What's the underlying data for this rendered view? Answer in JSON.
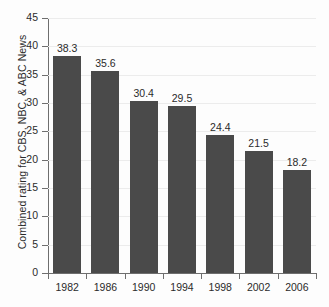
{
  "chart_data": {
    "type": "bar",
    "title": "",
    "xlabel": "",
    "ylabel": "Combined rating for CBS, NBC, & ABC News",
    "categories": [
      "1982",
      "1986",
      "1990",
      "1994",
      "1998",
      "2002",
      "2006"
    ],
    "values": [
      38.3,
      35.6,
      30.4,
      29.5,
      24.4,
      21.5,
      18.2
    ],
    "value_labels": [
      "38.3",
      "35.6",
      "30.4",
      "29.5",
      "24.4",
      "21.5",
      "18.2"
    ],
    "ylim": [
      0,
      45
    ],
    "ytick_labels": [
      "0",
      "5",
      "10",
      "15",
      "20",
      "25",
      "30",
      "35",
      "40",
      "45"
    ],
    "ytick_values": [
      0,
      5,
      10,
      15,
      20,
      25,
      30,
      35,
      40,
      45
    ],
    "grid": true,
    "legend": "none",
    "bar_color": "#4a4a4a",
    "gridline_color": "#ececec",
    "axis_color": "#6e6e6e",
    "background_color": "#fdfdfd"
  }
}
